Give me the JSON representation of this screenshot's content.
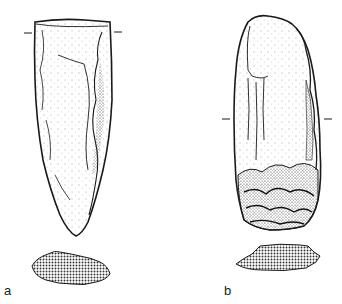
{
  "figure": {
    "colors": {
      "ink": "#1a1a1a",
      "paper": "#ffffff",
      "section_fill": "#9a9a9a"
    },
    "artifacts": [
      {
        "id": "a",
        "label": "a",
        "shape": "elongated pointed flake, flat top, tapering to point",
        "has_section_marks": true,
        "cross_section": "stippled lenticular section"
      },
      {
        "id": "b",
        "label": "b",
        "shape": "elongated core tool with rounded top and heavily worked base",
        "has_section_marks": true,
        "cross_section": "stippled irregular polygonal section"
      }
    ]
  }
}
